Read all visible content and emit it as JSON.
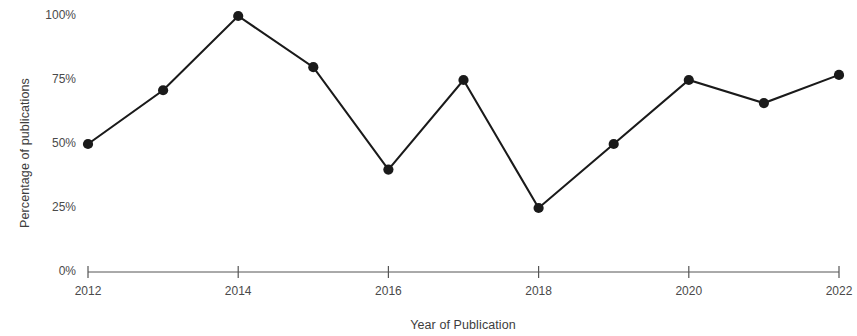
{
  "chart_data": {
    "type": "line",
    "title": "",
    "xlabel": "Year of Publication",
    "ylabel": "Percentage of publications",
    "x": [
      2012,
      2013,
      2014,
      2015,
      2016,
      2017,
      2018,
      2019,
      2020,
      2021,
      2022
    ],
    "values": [
      50,
      71,
      100,
      80,
      40,
      75,
      25,
      50,
      75,
      66,
      77
    ],
    "series": [
      {
        "name": "Percentage of publications",
        "values": [
          50,
          71,
          100,
          80,
          40,
          75,
          25,
          50,
          75,
          66,
          77
        ]
      }
    ],
    "x_tick_labels": [
      "2012",
      "2014",
      "2016",
      "2018",
      "2020",
      "2022"
    ],
    "x_tick_values": [
      2012,
      2014,
      2016,
      2018,
      2020,
      2022
    ],
    "y_tick_labels": [
      "0%",
      "25%",
      "50%",
      "75%",
      "100%"
    ],
    "y_tick_values": [
      0,
      25,
      50,
      75,
      100
    ],
    "xlim": [
      2012,
      2022
    ],
    "ylim": [
      0,
      100
    ],
    "grid": false,
    "legend": false,
    "legend_position": "none",
    "line_color": "#1a1a1a",
    "marker_color": "#1a1a1a",
    "marker_shape": "circle",
    "background_color": "#ffffff",
    "axis_color": "#555555"
  }
}
